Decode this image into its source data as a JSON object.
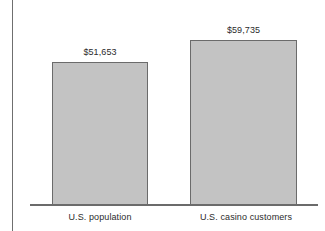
{
  "chart_data": {
    "type": "bar",
    "title": "",
    "subtitle": "",
    "xlabel": "",
    "ylabel": "",
    "categories": [
      "U.S. population",
      "U.S. casino customers"
    ],
    "values": [
      51653,
      59735
    ],
    "value_labels": [
      "$51,653",
      "$59,735"
    ],
    "ylim": [
      0,
      59735
    ],
    "grid": false,
    "legend": false,
    "series": [
      {
        "name": "Median household income",
        "values": [
          51653,
          59735
        ],
        "value_labels": [
          "$51,653",
          "$59,735"
        ]
      }
    ],
    "bar_fill_color": "#c3c3c3",
    "bar_border_color": "#6b6b6b",
    "axis_color": "#6b6b6b",
    "background_color": "#ffffff",
    "text_color": "#2b2b2b"
  },
  "figure": {
    "bars": [
      {
        "category": "U.S. population",
        "value_label": "$51,653"
      },
      {
        "category": "U.S. casino customers",
        "value_label": "$59,735"
      }
    ]
  }
}
